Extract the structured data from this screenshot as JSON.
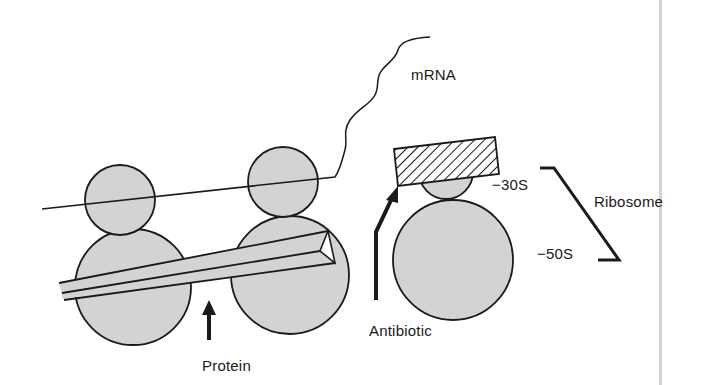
{
  "figure": {
    "labels": {
      "mrna": "mRNA",
      "subunit_small": "−30S",
      "subunit_large": "−50S",
      "ribosome": "Ribosome",
      "antibiotic": "Antibiotic",
      "protein": "Protein"
    },
    "colors": {
      "subunit_fill": "#d3d3d3",
      "outline": "#1a1a1a",
      "background": "#ffffff",
      "divider": "#d4d4d4"
    },
    "components": [
      {
        "id": "ribosome-1",
        "subunits": [
          "30S",
          "50S"
        ],
        "state": "translating"
      },
      {
        "id": "ribosome-2",
        "subunits": [
          "30S",
          "50S"
        ],
        "state": "translating, holds protein chain"
      },
      {
        "id": "ribosome-3",
        "subunits": [
          "30S",
          "50S"
        ],
        "state": "blocked by antibiotic"
      }
    ]
  }
}
